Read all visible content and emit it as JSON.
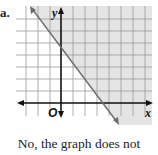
{
  "part_label": "a.",
  "graph": {
    "y_axis_label": "y",
    "x_axis_label": "x",
    "origin_label": "O",
    "shade_color": "#e4e4e4",
    "grid_color": "#9a9a9a",
    "line_color": "#6e6e6e",
    "axis_color": "#111111"
  },
  "caption": {
    "line1": "No, the graph does not",
    "line2": "represent a function, b"
  }
}
